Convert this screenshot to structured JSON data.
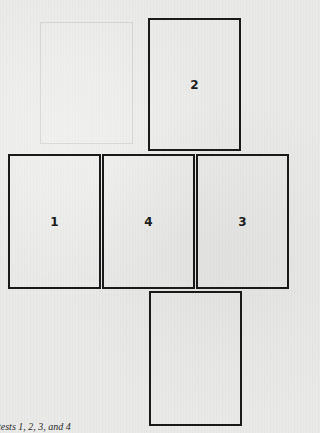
{
  "diagram": {
    "type": "net-layout",
    "panels": [
      {
        "id": "top",
        "label": "2",
        "left": 148,
        "top": 18,
        "width": 93,
        "height": 133
      },
      {
        "id": "middle-left",
        "label": "1",
        "left": 8,
        "top": 154,
        "width": 93,
        "height": 135
      },
      {
        "id": "middle-center",
        "label": "4",
        "left": 102,
        "top": 154,
        "width": 93,
        "height": 135
      },
      {
        "id": "middle-right",
        "label": "3",
        "left": 196,
        "top": 154,
        "width": 93,
        "height": 135
      },
      {
        "id": "bottom",
        "label": "",
        "left": 149,
        "top": 291,
        "width": 93,
        "height": 135
      }
    ],
    "caption": "tests 1, 2, 3, and 4",
    "colors": {
      "background": "#e9e9e7",
      "stroke": "#1a1a1a",
      "text": "#1c1c1c"
    }
  }
}
